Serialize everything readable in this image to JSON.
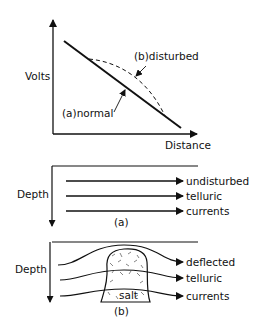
{
  "panel_top": {
    "y_axis_label": "Volts",
    "x_axis_label": "Distance",
    "curve_normal_label": "(a)normal",
    "curve_disturbed_label": "(b)disturbed"
  },
  "panel_middle": {
    "y_axis_label": "Depth",
    "arrow_labels": [
      "undisturbed",
      "telluric",
      "currents"
    ],
    "caption": "(a)"
  },
  "panel_bottom": {
    "y_axis_label": "Depth",
    "arrow_labels": [
      "deflected",
      "telluric",
      "currents"
    ],
    "body_label": "salt",
    "caption": "(b)"
  },
  "colors": {
    "ink": "#111111",
    "background": "#ffffff"
  }
}
